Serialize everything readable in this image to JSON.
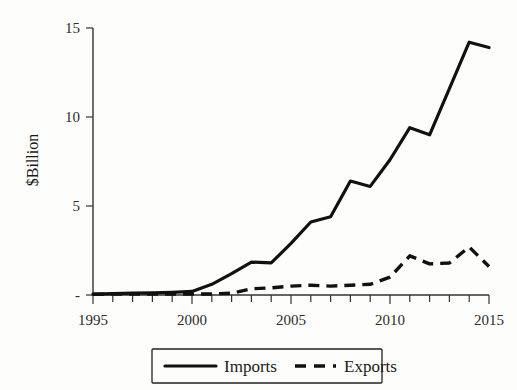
{
  "chart_data": {
    "type": "line",
    "title": "",
    "xlabel": "",
    "ylabel": "$Billion",
    "xlim": [
      1995,
      2015
    ],
    "ylim": [
      0,
      15
    ],
    "grid": false,
    "legend_position": "bottom",
    "y_ticks": [
      "-",
      "5",
      "10",
      "15"
    ],
    "y_tick_values": [
      0,
      5,
      10,
      15
    ],
    "x_ticks": [
      "1995",
      "2000",
      "2005",
      "2010",
      "2015"
    ],
    "x_tick_values": [
      1995,
      2000,
      2005,
      2010,
      2015
    ],
    "x_minor_tick_step": 1,
    "x": [
      1995,
      1996,
      1997,
      1998,
      1999,
      2000,
      2001,
      2002,
      2003,
      2004,
      2005,
      2006,
      2007,
      2008,
      2009,
      2010,
      2011,
      2012,
      2013,
      2014,
      2015
    ],
    "series": [
      {
        "name": "Imports",
        "style": "solid",
        "color": "#111111",
        "values": [
          0.05,
          0.08,
          0.1,
          0.12,
          0.15,
          0.2,
          0.6,
          1.2,
          1.85,
          1.8,
          2.9,
          4.1,
          4.4,
          6.4,
          6.1,
          7.6,
          9.4,
          9.0,
          11.6,
          14.2,
          13.9
        ]
      },
      {
        "name": "Exports",
        "style": "dashed",
        "color": "#111111",
        "values": [
          0.04,
          0.05,
          0.06,
          0.06,
          0.05,
          0.05,
          0.06,
          0.1,
          0.35,
          0.4,
          0.5,
          0.55,
          0.5,
          0.55,
          0.6,
          1.0,
          2.2,
          1.75,
          1.8,
          2.7,
          1.6
        ]
      }
    ],
    "legend": [
      {
        "label": "Imports",
        "style": "solid"
      },
      {
        "label": "Exports",
        "style": "dashed"
      }
    ]
  },
  "colors": {
    "background": "#fdfdfb",
    "ink": "#111111",
    "axis": "#333333"
  }
}
